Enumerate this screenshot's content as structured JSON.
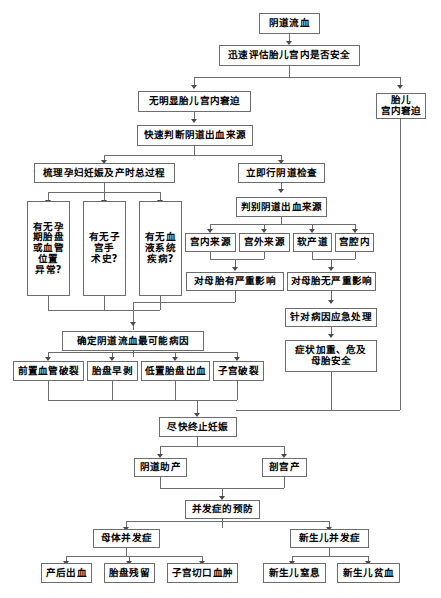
{
  "diagram": {
    "nodes": {
      "n_start": "阴道流血",
      "n_assess": "迅速评估胎儿宫内是否安全",
      "n_no_distress": "无明显胎儿宫内窘迫",
      "n_distress": "胎儿\n宫内窘迫",
      "n_judge_source": "快速判断阴道出血来源",
      "n_history": "梳理孕妇妊娠及产时总过程",
      "n_exam": "立即行阴道检查",
      "n_discriminate": "判别阴道出血来源",
      "n_q1": "有无孕\n期胎盘\n或血管\n位置\n异常?",
      "n_q2": "有无子\n宫手\n术史?",
      "n_q3": "有无血\n液系统\n疾病?",
      "n_src_intra": "宫内来源",
      "n_src_extra": "宫外来源",
      "n_src_soft": "软产道",
      "n_src_cavity": "宫腔内",
      "n_severe": "对母胎有严重影响",
      "n_not_severe": "对母胎无严重影响",
      "n_emergency": "针对病因应急处理",
      "n_worsen": "症状加重、危及\n母胎安全",
      "n_cause": "确定阴道流血最可能病因",
      "n_c1": "前置血管破裂",
      "n_c2": "胎盘早剥",
      "n_c3": "低置胎盘出血",
      "n_c4": "子宫破裂",
      "n_terminate": "尽快终止妊娠",
      "n_vaginal": "阴道助产",
      "n_cesarean": "剖宫产",
      "n_prevention": "并发症的预防",
      "n_maternal": "母体并发症",
      "n_neonatal": "新生儿并发症",
      "n_m1": "产后出血",
      "n_m2": "胎盘残留",
      "n_m3": "子宫切口血肿",
      "n_nb1": "新生儿窒息",
      "n_nb2": "新生儿贫血"
    },
    "colors": {
      "border": "#6d6d6d",
      "text": "#000000",
      "background": "#ffffff",
      "arrow": "#4a4a4a"
    }
  }
}
